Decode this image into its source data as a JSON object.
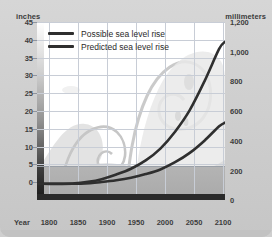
{
  "chart_data": {
    "type": "line",
    "title": "",
    "xlabel": "Year",
    "ylabel": "inches",
    "y2label": "millimeters",
    "x": [
      1800,
      1850,
      1900,
      1950,
      2000,
      2050,
      2100
    ],
    "xlim": [
      1790,
      2110
    ],
    "ylim": [
      -2.5,
      47
    ],
    "y2lim": [
      -64,
      1200
    ],
    "grid": true,
    "legend_position": "upper-left",
    "xticks": [
      "1800",
      "1850",
      "1900",
      "1950",
      "2000",
      "2050",
      "2100"
    ],
    "yticks": [
      "0",
      "5",
      "10",
      "15",
      "20",
      "25",
      "30",
      "35",
      "40",
      "45"
    ],
    "y2ticks": [
      "0",
      "200",
      "400",
      "600",
      "800",
      "1,000",
      "1,200"
    ],
    "series": [
      {
        "name": "Possible sea level rise",
        "color": "#2f2f2f",
        "x": [
          1790,
          1800,
          1850,
          1880,
          1900,
          1925,
          1950,
          1975,
          2000,
          2025,
          2050,
          2075,
          2100,
          2110
        ],
        "values": [
          2.0,
          2.0,
          2.1,
          2.6,
          3.3,
          4.6,
          6.2,
          8.5,
          11.8,
          16.5,
          22.5,
          30.5,
          39.5,
          41.5
        ]
      },
      {
        "name": "Predicted sea level rise",
        "color": "#2f2f2f",
        "x": [
          1790,
          1800,
          1850,
          1880,
          1900,
          1925,
          1950,
          1975,
          2000,
          2025,
          2050,
          2075,
          2100,
          2110
        ],
        "values": [
          2.0,
          2.0,
          2.0,
          2.2,
          2.5,
          3.0,
          3.7,
          4.7,
          6.0,
          8.0,
          10.6,
          14.0,
          18.0,
          19.0
        ]
      }
    ]
  },
  "legend": {
    "items": [
      {
        "label": "Possible sea level rise"
      },
      {
        "label": "Predicted sea level rise"
      }
    ]
  },
  "axes": {
    "left_caption": "inches",
    "right_caption": "millimeters",
    "x_name": "Year"
  },
  "colors": {
    "line": "#2f2f2f",
    "grid": "#c8cdd6",
    "plot_background": "#ffffff",
    "card_background": "#d0d0d0",
    "water_band": "#b0b0b0",
    "sea_floor": "#2a2a2a",
    "wave_art": "#bcbcbc"
  }
}
